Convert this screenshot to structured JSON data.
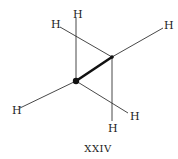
{
  "diagram": {
    "type": "sawhorse-projection",
    "molecule": "ethane",
    "caption": "XXIV",
    "atoms": {
      "front_carbon": "C",
      "back_carbon": "C",
      "hydrogens": [
        "H",
        "H",
        "H",
        "H",
        "H",
        "H"
      ]
    },
    "labels": {
      "h_top": "H",
      "h_upper_left": "H",
      "h_upper_right": "H",
      "h_left": "H",
      "h_lower_right": "H",
      "h_bottom": "H"
    },
    "colors": {
      "ink": "#222222",
      "background": "#ffffff"
    }
  }
}
